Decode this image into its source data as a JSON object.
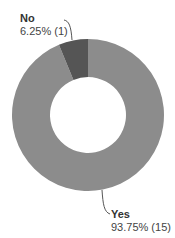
{
  "chart_data": {
    "type": "pie",
    "variant": "donut",
    "title": "",
    "categories": [
      "No",
      "Yes"
    ],
    "values": [
      1,
      15
    ],
    "percentages": [
      6.25,
      93.75
    ],
    "colors": [
      "#555555",
      "#8c8c8c"
    ],
    "labels": [
      {
        "name": "No",
        "value_text": "6.25% (1)"
      },
      {
        "name": "Yes",
        "value_text": "93.75% (15)"
      }
    ],
    "legend": "none",
    "start_angle_deg": 0,
    "direction": "clockwise_from_top_yes_first"
  },
  "labels": {
    "no": {
      "name": "No",
      "value": "6.25% (1)"
    },
    "yes": {
      "name": "Yes",
      "value": "93.75% (15)"
    }
  }
}
